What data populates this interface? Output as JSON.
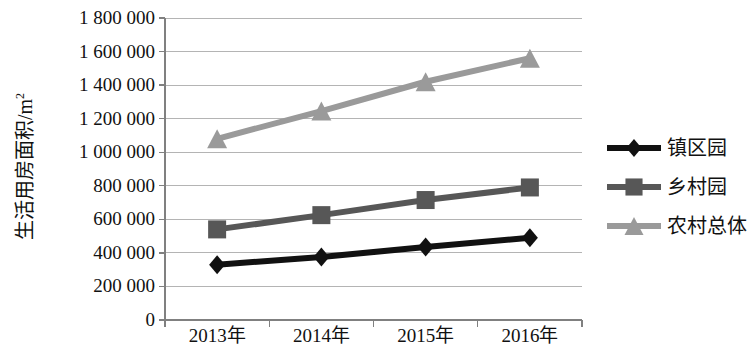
{
  "chart_data": {
    "type": "line",
    "title": "",
    "xlabel": "",
    "ylabel": "生活用房面积/m",
    "ylabel_sup": "2",
    "categories": [
      "2013年",
      "2014年",
      "2015年",
      "2016年"
    ],
    "ylim": [
      0,
      1800000
    ],
    "ytick_step": 200000,
    "ytick_labels": [
      "1 800 000",
      "1 600 000",
      "1 400 000",
      "1 200 000",
      "1 000 000",
      "800 000",
      "600 000",
      "400 000",
      "200 000",
      "0"
    ],
    "ytick_values": [
      1800000,
      1600000,
      1400000,
      1200000,
      1000000,
      800000,
      600000,
      400000,
      200000,
      0
    ],
    "grid": true,
    "legend_position": "right",
    "series": [
      {
        "name": "镇区园",
        "marker": "diamond",
        "color": "#111111",
        "values": [
          330000,
          375000,
          435000,
          490000
        ]
      },
      {
        "name": "乡村园",
        "marker": "square",
        "color": "#575757",
        "values": [
          540000,
          625000,
          715000,
          790000
        ]
      },
      {
        "name": "农村总体",
        "marker": "triangle",
        "color": "#9a9a9a",
        "values": [
          1080000,
          1245000,
          1420000,
          1560000
        ]
      }
    ]
  },
  "axes": {
    "axis_color": "#808080",
    "grid_color": "#b4b4b4"
  }
}
